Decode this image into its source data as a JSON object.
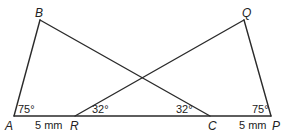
{
  "diagram": {
    "points": {
      "A": {
        "label": "A",
        "x": 14,
        "y": 116
      },
      "B": {
        "label": "B",
        "x": 40,
        "y": 20
      },
      "R": {
        "label": "R",
        "x": 75,
        "y": 116
      },
      "C": {
        "label": "C",
        "x": 210,
        "y": 116
      },
      "P": {
        "label": "P",
        "x": 271,
        "y": 116
      },
      "Q": {
        "label": "Q",
        "x": 244,
        "y": 20
      }
    },
    "angles": {
      "A": "75°",
      "R": "32°",
      "C": "32°",
      "P": "75°"
    },
    "lengths": {
      "AR": "5 mm",
      "CP": "5 mm"
    },
    "stroke_color": "#2a2a2a"
  }
}
